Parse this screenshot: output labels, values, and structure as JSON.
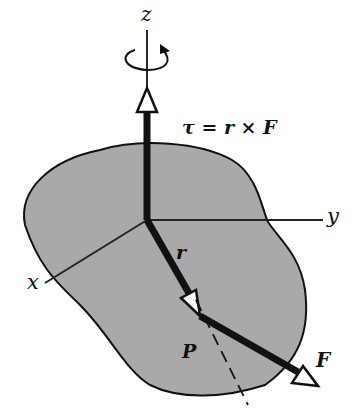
{
  "diagram": {
    "labels": {
      "z_axis": "z",
      "y_axis": "y",
      "x_axis": "x",
      "torque_equation": "τ = r × F",
      "position_vector": "r",
      "point": "P",
      "force": "F"
    },
    "colors": {
      "body_fill": "#a9a9a9",
      "stroke": "#111111",
      "background": "#ffffff"
    },
    "icons": {
      "rotation": "circular-arrow-counterclockwise"
    }
  }
}
